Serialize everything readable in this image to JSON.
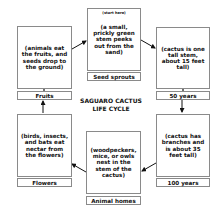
{
  "diagram": {
    "title_line1": "SAGUARO CACTUS",
    "title_line2": "LIFE CYCLE",
    "stages": [
      {
        "id": "seed-sprouts",
        "label": "Seed sprouts",
        "note": "(start here)",
        "description": "(a small, prickly green stem peeks out from the sand)"
      },
      {
        "id": "50-years",
        "label": "50 years",
        "description": "(cactus is one tall stem, about 15 feet tall)"
      },
      {
        "id": "100-years",
        "label": "100 years",
        "description": "(cactus has branches and is about 35 feet tall)"
      },
      {
        "id": "animal-homes",
        "label": "Animal homes",
        "description": "(woodpeckers, mice, or owls nest in the stem of the cactus)"
      },
      {
        "id": "flowers",
        "label": "Flowers",
        "description": "(birds, insects, and bats eat nectar from the flowers)"
      },
      {
        "id": "fruits",
        "label": "Fruits",
        "description": "(animals eat the fruits, and seeds drop to the ground)"
      }
    ],
    "flow": [
      [
        "fruits",
        "seed-sprouts"
      ],
      [
        "seed-sprouts",
        "50-years"
      ],
      [
        "50-years",
        "100-years"
      ],
      [
        "100-years",
        "animal-homes"
      ],
      [
        "animal-homes",
        "flowers"
      ],
      [
        "flowers",
        "fruits"
      ]
    ],
    "colors": {
      "border": "#8a8a8a",
      "text": "#111111",
      "arrow": "#111111"
    }
  }
}
